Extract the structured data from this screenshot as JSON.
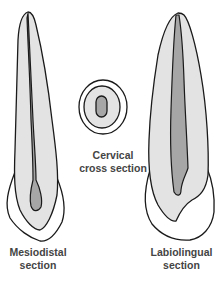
{
  "figure": {
    "colors": {
      "outline": "#1a1a1a",
      "dentin": "#e3e3e3",
      "pulp": "#a6a6a6",
      "enamel": "#ffffff",
      "label": "#444444"
    },
    "labels": {
      "mesiodistal": [
        "Mesiodistal",
        "section"
      ],
      "cervical": [
        "Cervical",
        "cross section"
      ],
      "labiolingual": [
        "Labiolingual",
        "section"
      ]
    }
  }
}
